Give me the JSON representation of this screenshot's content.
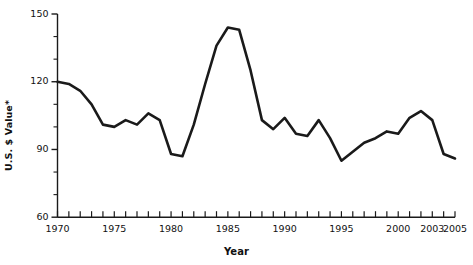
{
  "chart_data": {
    "type": "line",
    "title": "",
    "xlabel": "Year",
    "ylabel": "U.S. $ Value*",
    "xlim": [
      1970,
      2005
    ],
    "ylim": [
      60,
      150
    ],
    "grid": false,
    "legend": "none",
    "x_ticks_major": [
      1970,
      1975,
      1980,
      1985,
      1990,
      1995,
      2000,
      2003,
      2005
    ],
    "x_tick_labels": [
      "1970",
      "1975",
      "1980",
      "1985",
      "1990",
      "1995",
      "2000",
      "2003",
      "2005"
    ],
    "x_tick_minor_step": 1,
    "y_ticks_major": [
      60,
      90,
      120,
      150
    ],
    "y_tick_labels": [
      "60",
      "90",
      "120",
      "150"
    ],
    "y_tick_minor_step": 10,
    "series_name": "U.S. $ Value",
    "line_color": "#1a1a1a",
    "line_width": 2.6,
    "x": [
      1970,
      1971,
      1972,
      1973,
      1974,
      1975,
      1976,
      1977,
      1978,
      1979,
      1980,
      1981,
      1982,
      1983,
      1984,
      1985,
      1986,
      1987,
      1988,
      1989,
      1990,
      1991,
      1992,
      1993,
      1994,
      1995,
      1996,
      1997,
      1998,
      1999,
      2000,
      2001,
      2002,
      2003,
      2004,
      2005
    ],
    "values": [
      120,
      119,
      116,
      110,
      101,
      100,
      103,
      101,
      106,
      103,
      88,
      87,
      101,
      119,
      136,
      144,
      143,
      125,
      103,
      99,
      104,
      97,
      96,
      103,
      95,
      85,
      89,
      93,
      95,
      98,
      97,
      104,
      107,
      103,
      88,
      86
    ]
  },
  "axes": {
    "y_title": "U.S. $ Value*",
    "x_title": "Year"
  }
}
